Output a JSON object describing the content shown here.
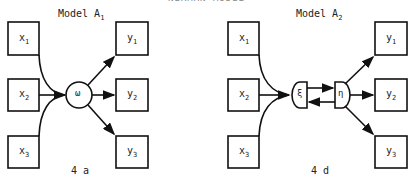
{
  "header": {
    "text": "NERMAN MODEL"
  },
  "panels": [
    {
      "title": "Model A",
      "title_sub": "1",
      "caption": "4 a",
      "inputs": [
        {
          "v": "x",
          "s": "1"
        },
        {
          "v": "x",
          "s": "2"
        },
        {
          "v": "x",
          "s": "3"
        }
      ],
      "outputs": [
        {
          "v": "y",
          "s": "1"
        },
        {
          "v": "y",
          "s": "2"
        },
        {
          "v": "y",
          "s": "3"
        }
      ],
      "latent": {
        "symbol": "ω"
      }
    },
    {
      "title": "Model A",
      "title_sub": "2",
      "caption": "4 d",
      "inputs": [
        {
          "v": "x",
          "s": "1"
        },
        {
          "v": "x",
          "s": "2"
        },
        {
          "v": "x",
          "s": "3"
        }
      ],
      "outputs": [
        {
          "v": "y",
          "s": "1"
        },
        {
          "v": "y",
          "s": "2"
        },
        {
          "v": "y",
          "s": "3"
        }
      ],
      "latent_in": {
        "symbol": "ξ"
      },
      "latent_out": {
        "symbol": "η"
      }
    }
  ]
}
